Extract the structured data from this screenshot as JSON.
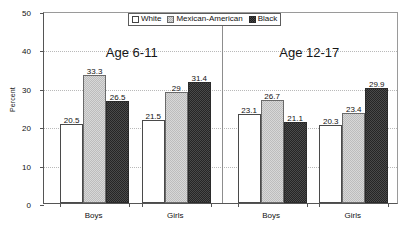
{
  "chart_data": {
    "type": "bar",
    "title": "",
    "xlabel": "",
    "ylabel": "Percent",
    "ylim": [
      0,
      50
    ],
    "ytick_labels": [
      "0",
      "10",
      "20",
      "30",
      "40",
      "50"
    ],
    "ytick_values": [
      0,
      10,
      20,
      30,
      40,
      50
    ],
    "grid": true,
    "legend_position": "top-center",
    "panels": [
      {
        "title": "Age 6-11",
        "categories": [
          "Boys",
          "Girls"
        ]
      },
      {
        "title": "Age 12-17",
        "categories": [
          "Boys",
          "Girls"
        ]
      }
    ],
    "categories": [
      "Boys",
      "Girls",
      "Boys",
      "Girls"
    ],
    "group_labels": [
      "Age 6-11 Boys",
      "Age 6-11 Girls",
      "Age 12-17 Boys",
      "Age 12-17 Girls"
    ],
    "series": [
      {
        "name": "White",
        "values": [
          20.5,
          21.5,
          23.1,
          20.3
        ],
        "value_labels": [
          "20.5",
          "21.5",
          "23.1",
          "20.3"
        ],
        "color": "#ffffff",
        "pattern": "solid-outlined"
      },
      {
        "name": "Mexican-American",
        "values": [
          33.3,
          29,
          26.7,
          23.4
        ],
        "value_labels": [
          "33.3",
          "29",
          "26.7",
          "23.4"
        ],
        "color": "#d8d8d8",
        "pattern": "light-checker"
      },
      {
        "name": "Black",
        "values": [
          26.5,
          31.4,
          21.1,
          29.9
        ],
        "value_labels": [
          "26.5",
          "31.4",
          "21.1",
          "29.9"
        ],
        "color": "#454545",
        "pattern": "dark-checker"
      }
    ],
    "legend": [
      "White",
      "Mexican-American",
      "Black"
    ]
  }
}
